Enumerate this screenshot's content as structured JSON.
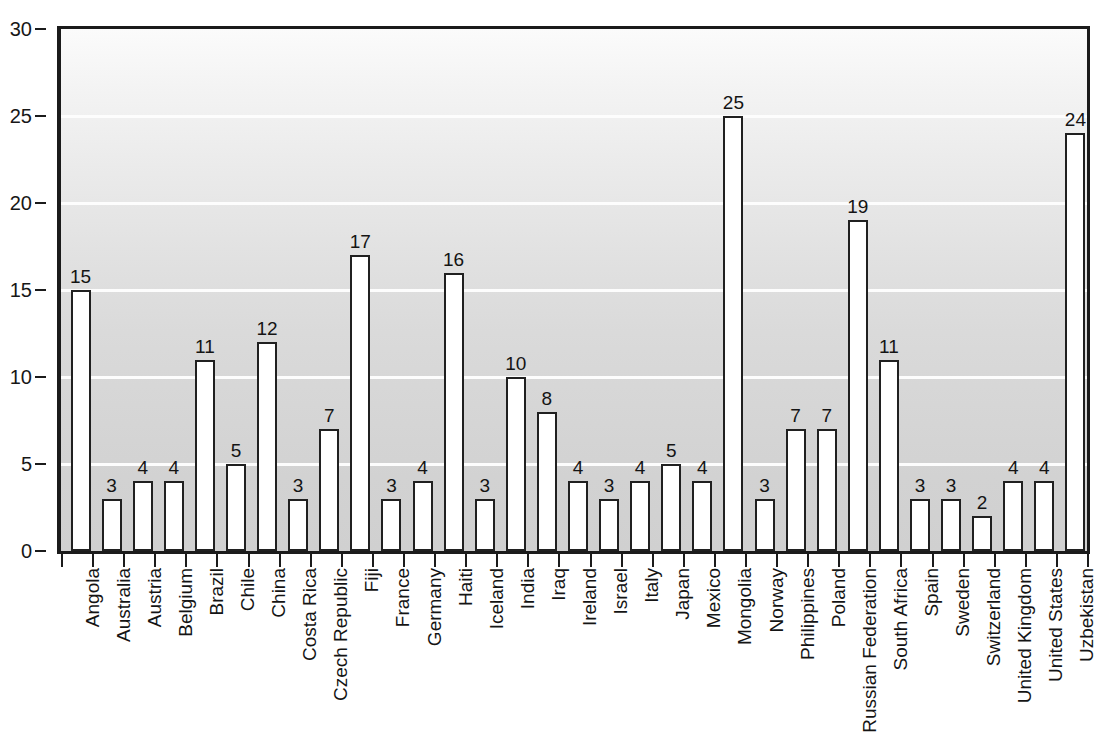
{
  "chart_data": {
    "type": "bar",
    "title": "",
    "subtitle": "",
    "xlabel": "",
    "ylabel": "",
    "ylim": [
      0,
      30
    ],
    "y_ticks": [
      0,
      5,
      10,
      15,
      20,
      25,
      30
    ],
    "grid": true,
    "grid_orientation": "horizontal",
    "legend": "none",
    "bar_color": "#ffffff",
    "bar_outline_color": "#202020",
    "axis_color": "#1b1b1b",
    "plot_background": "gray-vertical-gradient",
    "value_labels_shown": true,
    "categories": [
      "Angola",
      "Australia",
      "Austria",
      "Belgium",
      "Brazil",
      "Chile",
      "China",
      "Costa Rica",
      "Czech Republic",
      "Fiji",
      "France",
      "Germany",
      "Haiti",
      "Iceland",
      "India",
      "Iraq",
      "Ireland",
      "Israel",
      "Italy",
      "Japan",
      "Mexico",
      "Mongolia",
      "Norway",
      "Philippines",
      "Poland",
      "Russian Federation",
      "South Africa",
      "Spain",
      "Sweden",
      "Switzerland",
      "United Kingdom",
      "United States",
      "Uzbekistan"
    ],
    "values": [
      15,
      3,
      4,
      4,
      11,
      5,
      12,
      3,
      7,
      17,
      3,
      4,
      16,
      3,
      10,
      8,
      4,
      3,
      4,
      5,
      4,
      25,
      3,
      7,
      7,
      19,
      11,
      3,
      3,
      2,
      4,
      4,
      24
    ],
    "value_labels": [
      "15",
      "3",
      "4",
      "4",
      "11",
      "5",
      "12",
      "3",
      "7",
      "17",
      "3",
      "4",
      "16",
      "3",
      "10",
      "8",
      "4",
      "3",
      "4",
      "5",
      "4",
      "25",
      "3",
      "7",
      "7",
      "19",
      "11",
      "3",
      "3",
      "2",
      "4",
      "4",
      "24"
    ]
  }
}
